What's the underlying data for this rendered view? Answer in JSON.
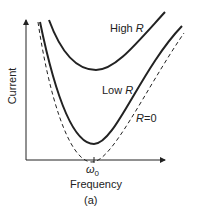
{
  "figure": {
    "y_axis_label": "Current",
    "x_axis_label": "Frequency",
    "x_tick_label": "ω",
    "x_tick_sub": "0",
    "caption": "(a)",
    "curves": [
      {
        "name": "High R",
        "prefix": "High ",
        "var": "R",
        "style": "solid"
      },
      {
        "name": "Low R",
        "prefix": "Low ",
        "var": "R",
        "style": "solid"
      },
      {
        "name": "R = 0",
        "var": "R",
        "suffix": "=0",
        "style": "dashed"
      }
    ],
    "color": "#222222"
  }
}
